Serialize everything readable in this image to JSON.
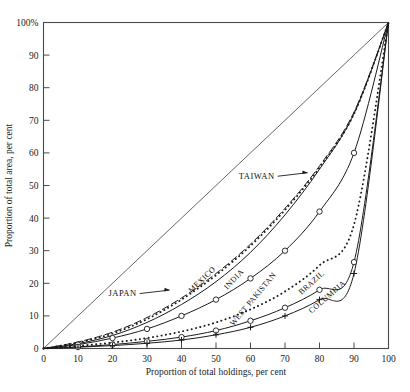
{
  "chart_data": {
    "type": "line",
    "title": "",
    "xlabel": "Proportion of total holdings, per cent",
    "ylabel": "Proportion of total area, per cent",
    "xlim": [
      0,
      100
    ],
    "ylim": [
      0,
      100
    ],
    "grid": false,
    "legend": "inline-labels",
    "x_ticks": [
      "0",
      "10",
      "20",
      "30",
      "40",
      "50",
      "60",
      "70",
      "80",
      "90",
      "100"
    ],
    "x_tick_values": [
      0,
      10,
      20,
      30,
      40,
      50,
      60,
      70,
      80,
      90,
      100
    ],
    "y_ticks": [
      "0",
      "10",
      "20",
      "30",
      "40",
      "50",
      "60",
      "70",
      "80",
      "90",
      "100%"
    ],
    "y_tick_values": [
      0,
      10,
      20,
      30,
      40,
      50,
      60,
      70,
      80,
      90,
      100
    ],
    "x": [
      0,
      10,
      20,
      30,
      40,
      50,
      60,
      70,
      80,
      90,
      100
    ],
    "series": [
      {
        "name": "equality-line",
        "label": "",
        "style": "solid",
        "marker": "none",
        "color": "#555555",
        "values": [
          0,
          10,
          20,
          30,
          40,
          50,
          60,
          70,
          80,
          90,
          100
        ]
      },
      {
        "name": "JAPAN",
        "label": "JAPAN",
        "style": "dashed",
        "marker": "none",
        "color": "#1a1a1a",
        "values": [
          0,
          2.0,
          5.0,
          9.5,
          15.5,
          23.0,
          32.0,
          43.0,
          56.0,
          72.5,
          100
        ]
      },
      {
        "name": "TAIWAN",
        "label": "TAIWAN",
        "style": "dotted",
        "marker": "none",
        "color": "#1a1a1a",
        "values": [
          0,
          1.8,
          4.6,
          9.0,
          15.0,
          22.5,
          31.5,
          42.5,
          55.5,
          72.0,
          100
        ]
      },
      {
        "name": "MEXICO",
        "label": "MEXICO",
        "style": "solid",
        "marker": "none",
        "color": "#1a1a1a",
        "values": [
          0,
          1.5,
          4.0,
          8.0,
          13.5,
          20.5,
          29.5,
          41.0,
          55.0,
          72.0,
          100
        ]
      },
      {
        "name": "INDIA",
        "label": "INDIA",
        "style": "solid",
        "marker": "circle",
        "color": "#1a1a1a",
        "values": [
          0,
          1.2,
          3.2,
          6.0,
          10.0,
          15.0,
          21.5,
          30.0,
          42.0,
          60.0,
          100
        ]
      },
      {
        "name": "WEST PAKISTAN",
        "label": "WEST PAKISTAN",
        "style": "dotted",
        "marker": "none",
        "color": "#1a1a1a",
        "values": [
          0,
          0.8,
          1.8,
          3.2,
          5.2,
          8.0,
          12.0,
          17.5,
          25.5,
          38.0,
          100
        ]
      },
      {
        "name": "BRAZIL",
        "label": "BRAZIL",
        "style": "solid",
        "marker": "circle",
        "color": "#1a1a1a",
        "values": [
          0,
          0.5,
          1.2,
          2.2,
          3.5,
          5.5,
          8.5,
          12.5,
          18.0,
          26.5,
          100
        ]
      },
      {
        "name": "COLUMBIA",
        "label": "COLUMBIA",
        "style": "solid",
        "marker": "plus",
        "color": "#1a1a1a",
        "values": [
          0,
          0.4,
          0.9,
          1.6,
          2.6,
          4.2,
          6.5,
          10.0,
          15.0,
          23.0,
          100
        ]
      }
    ],
    "annotations": [
      {
        "name": "japan-callout",
        "text": "JAPAN",
        "x": 27,
        "y": 17
      },
      {
        "name": "taiwan-callout",
        "text": "TAIWAN",
        "x": 67,
        "y": 53
      }
    ]
  }
}
